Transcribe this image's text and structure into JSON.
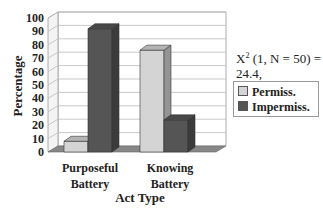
{
  "chart_data": {
    "type": "bar",
    "style": "3d-clustered-column",
    "title": "",
    "xlabel": "Act Type",
    "ylabel": "Percentage",
    "ylim": [
      0,
      100
    ],
    "yticks": [
      0,
      10,
      20,
      30,
      40,
      50,
      60,
      70,
      80,
      90,
      100
    ],
    "grid": true,
    "legend_position": "right",
    "categories": [
      "Purposeful Battery",
      "Knowing Battery"
    ],
    "series": [
      {
        "name": "Permiss.",
        "color": "#d4d4d4",
        "values": [
          8,
          76
        ]
      },
      {
        "name": "Impermiss.",
        "color": "#555555",
        "values": [
          92,
          24
        ]
      }
    ],
    "annotation": {
      "line1": "X² (1, N = 50) = 24.4,",
      "line2": "p < .001"
    }
  },
  "labels": {
    "ylabel": "Percentage",
    "xlabel": "Act Type",
    "cat0_line1": "Purposeful",
    "cat0_line2": "Battery",
    "cat1_line1": "Knowing",
    "cat1_line2": "Battery",
    "legend0": "Permiss.",
    "legend1": "Impermiss.",
    "stat_chi": "X",
    "stat_sup": "2",
    "stat_rest": " (1, N = 50) = 24.4,",
    "stat_p": "p < .001"
  }
}
